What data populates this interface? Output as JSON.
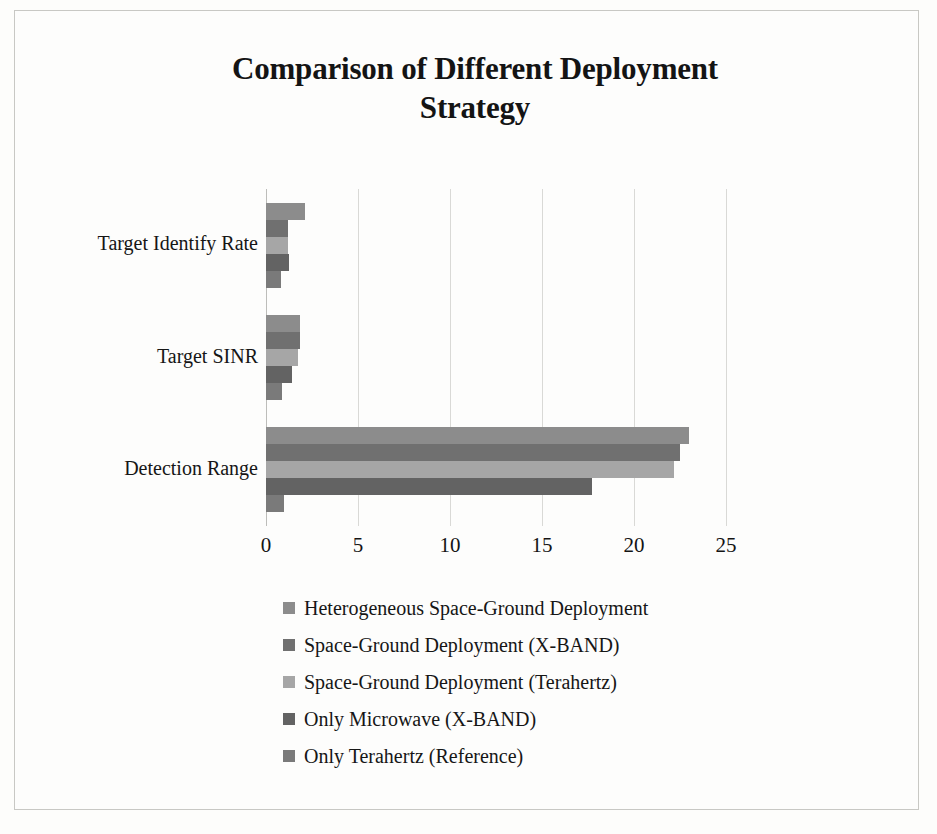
{
  "chart_data": {
    "type": "bar",
    "orientation": "horizontal",
    "title": "Comparison of Different Deployment Strategy",
    "title_line1": "Comparison of Different Deployment",
    "title_line2": "Strategy",
    "xlabel": "",
    "ylabel": "",
    "xlim": [
      0,
      25
    ],
    "xticks": [
      0,
      5,
      10,
      15,
      20,
      25
    ],
    "xtick_labels": [
      "0",
      "5",
      "10",
      "15",
      "20",
      "25"
    ],
    "grid": true,
    "grid_axis": "x",
    "legend_position": "bottom",
    "categories": [
      "Target Identify Rate",
      "Target SINR",
      "Detection Range"
    ],
    "series": [
      {
        "name": "Heterogeneous Space-Ground Deployment",
        "color": "#8c8c8c",
        "values": [
          2.1,
          1.85,
          23.0
        ]
      },
      {
        "name": "Space-Ground Deployment (X-BAND)",
        "color": "#707070",
        "values": [
          1.2,
          1.85,
          22.5
        ]
      },
      {
        "name": "Space-Ground Deployment (Terahertz)",
        "color": "#a6a6a6",
        "values": [
          1.2,
          1.75,
          22.2
        ]
      },
      {
        "name": "Only Microwave (X-BAND)",
        "color": "#636363",
        "values": [
          1.25,
          1.4,
          17.7
        ]
      },
      {
        "name": "Only Terahertz (Reference)",
        "color": "#7a7a7a",
        "values": [
          0.8,
          0.85,
          1.0
        ]
      }
    ]
  },
  "colors": {
    "background": "#fdfdfc",
    "frame_border": "#c8c8c4",
    "gridline": "#d9d9d6",
    "text": "#141414"
  }
}
